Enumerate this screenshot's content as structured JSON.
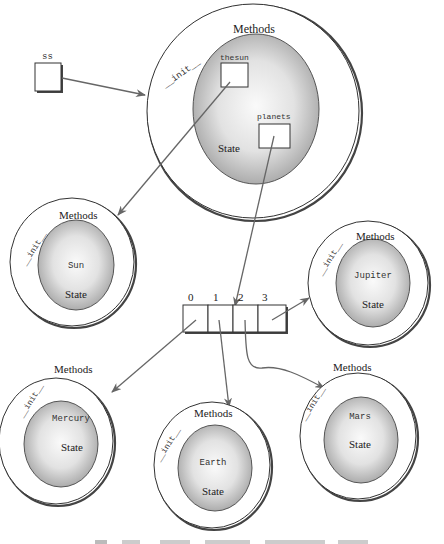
{
  "diagram": {
    "variable": {
      "name": "ss"
    },
    "solar_system": {
      "methods_label": "Methods",
      "init_label": "__init__",
      "state_label": "State",
      "attributes": [
        {
          "name": "thesun"
        },
        {
          "name": "planets"
        }
      ]
    },
    "planets_list": {
      "indices": [
        "0",
        "1",
        "2",
        "3"
      ]
    },
    "objects": [
      {
        "name": "Sun",
        "methods_label": "Methods",
        "init_label": "__init__",
        "state_label": "State"
      },
      {
        "name": "Jupiter",
        "methods_label": "Methods",
        "init_label": "__init__",
        "state_label": "State"
      },
      {
        "name": "Mercury",
        "methods_label": "Methods",
        "init_label": "__init__",
        "state_label": "State"
      },
      {
        "name": "Earth",
        "methods_label": "Methods",
        "init_label": "__init__",
        "state_label": "State"
      },
      {
        "name": "Mars",
        "methods_label": "Methods",
        "init_label": "__init__",
        "state_label": "State"
      }
    ],
    "colors": {
      "state_gradient_center": "#f7f7f7",
      "state_gradient_edge": "#a9a9a9",
      "arrow": "#666666",
      "outline": "#333333"
    }
  }
}
